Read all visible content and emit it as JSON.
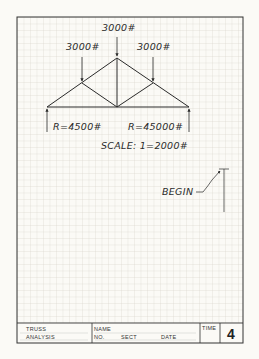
{
  "diagram": {
    "type": "truss_force_diagram_worksheet",
    "loads": [
      {
        "id": "top-center",
        "label": "3000#"
      },
      {
        "id": "top-left",
        "label": "3000#"
      },
      {
        "id": "top-right",
        "label": "3000#"
      }
    ],
    "reactions": [
      {
        "id": "left",
        "label": "R=4500#"
      },
      {
        "id": "right",
        "label": "R=45000#"
      }
    ],
    "scale_label": "SCALE:  1=2000#",
    "begin_label": "BEGIN"
  },
  "title_block": {
    "title_line1": "TRUSS",
    "title_line2": "ANALYSIS",
    "name_label": "NAME",
    "no_label": "NO.",
    "sect_label": "SECT",
    "date_label": "DATE",
    "time_label": "TIME",
    "sheet_number": "4"
  },
  "colors": {
    "paper": "#fbfaf6",
    "grid": "#d9d6cc",
    "ink": "#2a2a2a"
  }
}
